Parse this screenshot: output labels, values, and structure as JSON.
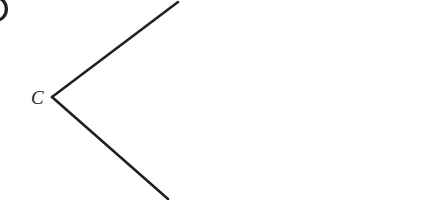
{
  "figure": {
    "type": "geometry-diagram",
    "width": 426,
    "height": 200,
    "background_color": "#FFFFFF",
    "stroke_color": "#231F20",
    "stroke_width": 2.6
  },
  "labels": {
    "vertex": {
      "text": "C",
      "x": 31,
      "y": 88,
      "font_size": 19,
      "style": "italic-serif",
      "color": "#231F20"
    }
  },
  "geometry": {
    "vertex": {
      "x": 52,
      "y": 97
    },
    "rays": [
      {
        "name": "upper-ray",
        "from": {
          "x": 52,
          "y": 97
        },
        "to": {
          "x": 178,
          "y": 2
        }
      },
      {
        "name": "lower-ray",
        "from": {
          "x": 52,
          "y": 97
        },
        "to": {
          "x": 168,
          "y": 199
        }
      }
    ]
  },
  "artifacts": {
    "clipped_glyph": {
      "name": "cropped-circular-glyph",
      "description": "right edge of a dark circular glyph clipped by the left image border",
      "cx": -4,
      "cy": 9,
      "rx": 12,
      "ry": 13,
      "color": "#231F20"
    }
  }
}
